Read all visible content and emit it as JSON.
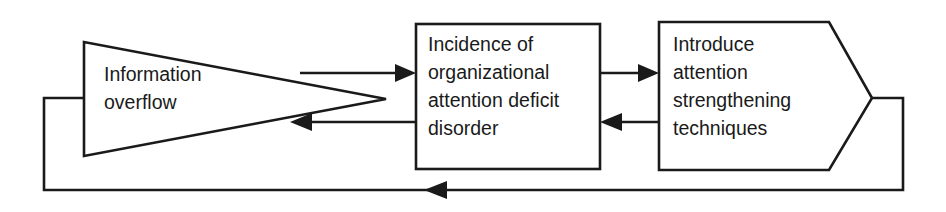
{
  "diagram": {
    "type": "feedback-loop-flow-diagram",
    "title": "",
    "background_color": "#ffffff",
    "line_color": "#1a1a1a",
    "text_color": "#1a1a1a",
    "nodes": [
      {
        "id": "information-overflow",
        "shape": "triangle",
        "label_lines": [
          "Information",
          "overflow"
        ],
        "line1": "Information",
        "line2": "overflow"
      },
      {
        "id": "attention-deficit-disorder",
        "shape": "rectangle",
        "label_lines": [
          "Incidence of",
          "organizational",
          "attention deficit",
          "disorder"
        ],
        "line1": "Incidence of",
        "line2": "organizational",
        "line3": "attention deficit",
        "line4": "disorder"
      },
      {
        "id": "attention-strengthening",
        "shape": "pentagon-arrow",
        "label_lines": [
          "Introduce",
          "attention",
          "strengthening",
          "techniques"
        ],
        "line1": "Introduce",
        "line2": "attention",
        "line3": "strengthening",
        "line4": "techniques"
      }
    ],
    "connectors": [
      {
        "id": "overflow-to-disorder",
        "from": "information-overflow",
        "to": "attention-deficit-disorder",
        "direction": "right",
        "label": ""
      },
      {
        "id": "disorder-to-overflow",
        "from": "attention-deficit-disorder",
        "to": "information-overflow",
        "direction": "left",
        "label": ""
      },
      {
        "id": "disorder-to-techniques",
        "from": "attention-deficit-disorder",
        "to": "attention-strengthening",
        "direction": "right",
        "label": ""
      },
      {
        "id": "techniques-to-disorder",
        "from": "attention-strengthening",
        "to": "attention-deficit-disorder",
        "direction": "left",
        "label": ""
      },
      {
        "id": "techniques-feedback-to-overflow",
        "from": "attention-strengthening",
        "to": "information-overflow",
        "direction": "left",
        "label": ""
      }
    ]
  }
}
